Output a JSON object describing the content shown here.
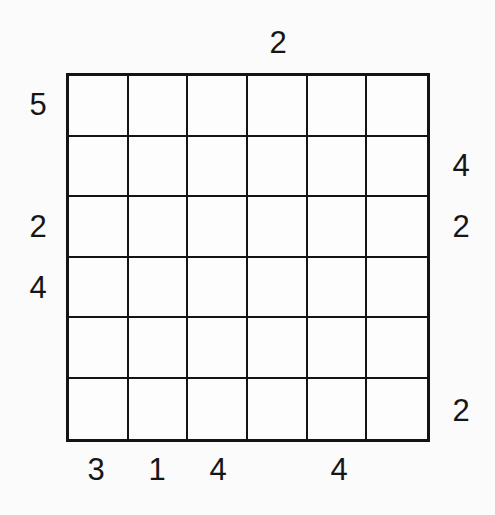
{
  "puzzle": {
    "type": "skyscrapers-grid",
    "size": 6,
    "clues": {
      "top": [
        "",
        "",
        "",
        "2",
        "",
        ""
      ],
      "left": [
        "5",
        "",
        "2",
        "4",
        "",
        ""
      ],
      "right": [
        "",
        "4",
        "2",
        "",
        "",
        "2"
      ],
      "bottom": [
        "3",
        "1",
        "4",
        "",
        "4",
        ""
      ]
    },
    "cells": [
      [
        "",
        "",
        "",
        "",
        "",
        ""
      ],
      [
        "",
        "",
        "",
        "",
        "",
        ""
      ],
      [
        "",
        "",
        "",
        "",
        "",
        ""
      ],
      [
        "",
        "",
        "",
        "",
        "",
        ""
      ],
      [
        "",
        "",
        "",
        "",
        "",
        ""
      ],
      [
        "",
        "",
        "",
        "",
        "",
        ""
      ]
    ],
    "colors": {
      "line": "#141414",
      "text": "#161616",
      "background": "#fbfbfb",
      "cell_fill": "#fdfdfd"
    }
  }
}
